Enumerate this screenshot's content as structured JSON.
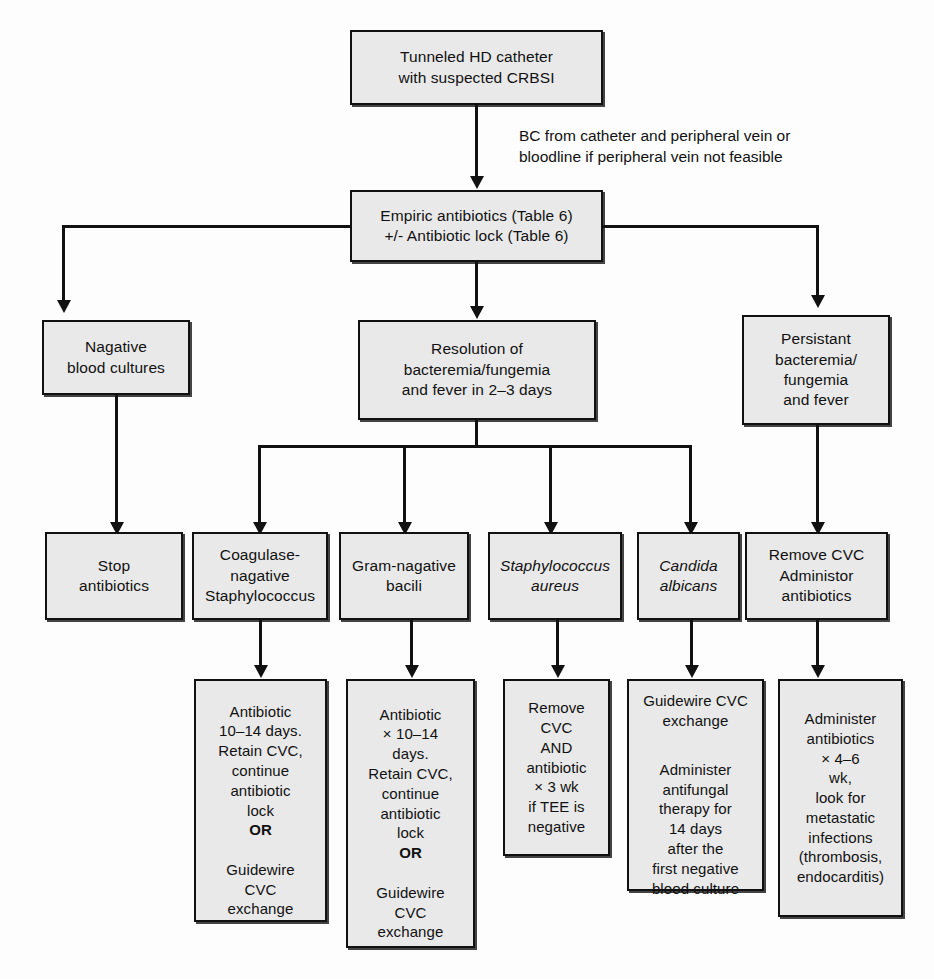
{
  "diagram": {
    "box_fill": "#e9e9e9",
    "line_color": "#111111",
    "nodes": {
      "start": "Tunneled HD catheter\nwith suspected CRBSI",
      "empiric": "Empiric antibiotics (Table 6)\n+/- Antibiotic lock (Table 6)",
      "negative_cultures": "Nagative\nblood cultures",
      "resolution": "Resolution of\nbacteremia/fungemia\nand fever in 2–3 days",
      "persistent": "Persistant\nbacteremia/\nfungemia\nand fever",
      "stop_antibiotics": "Stop\nantibiotics",
      "cons": "Coagulase-\nnagative\nStaphylococcus",
      "gram_negative": "Gram-nagative\nbacili",
      "staph_aureus": "Staphylococcus\naureus",
      "candida": "Candida\nalbicans",
      "remove_cvc_admin": "Remove CVC\nAdministor\nantibiotics",
      "tx_cons_a": "Antibiotic\n10–14 days.\nRetain CVC,\ncontinue\nantibiotic\nlock",
      "tx_cons_or": "OR",
      "tx_cons_b": "Guidewire\nCVC\nexchange",
      "tx_gn_a": "Antibiotic\n× 10–14\ndays.\nRetain CVC,\ncontinue\nantibiotic\nlock",
      "tx_gn_or": "OR",
      "tx_gn_b": "Guidewire\nCVC\nexchange",
      "tx_staph": "Remove\nCVC\nAND\nantibiotic\n× 3 wk\nif TEE is\nnegative",
      "tx_candida_a": "Guidewire CVC\nexchange",
      "tx_candida_b": "Administer\nantifungal\ntherapy for\n14 days\nafter the\nfirst negative\nblood culture",
      "tx_persistent": "Administer\nantibiotics\n× 4–6\nwk,\nlook for\nmetastatic\ninfections\n(thrombosis,\nendocarditis)"
    },
    "annotations": {
      "bc_note": "BC from catheter and peripheral vein or\nbloodline if peripheral vein not feasible"
    }
  }
}
